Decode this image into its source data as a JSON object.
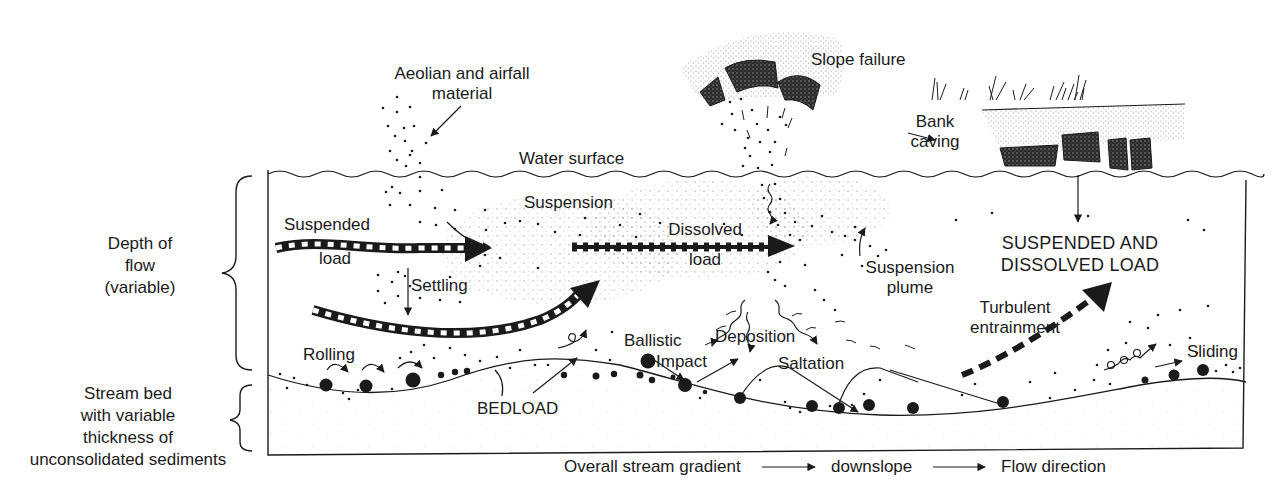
{
  "diagram": {
    "type": "stream sediment transport schematic",
    "labels": {
      "aeolian": [
        "Aeolian and airfall",
        "material"
      ],
      "slope_failure": "Slope failure",
      "bank_caving": [
        "Bank",
        "caving"
      ],
      "water_surface": "Water surface",
      "depth_of_flow": [
        "Depth of",
        "flow",
        "(variable)"
      ],
      "stream_bed": [
        "Stream bed",
        "with variable",
        "thickness of",
        "unconsolidated sediments"
      ],
      "suspended_load": [
        "Suspended",
        "load"
      ],
      "suspension": "Suspension",
      "dissolved_load": [
        "Dissolved",
        "load"
      ],
      "suspension_plume": [
        "Suspension",
        "plume"
      ],
      "suspended_and_dissolved": [
        "SUSPENDED AND",
        "DISSOLVED LOAD"
      ],
      "settling": "Settling",
      "turbulent_entrainment": [
        "Turbulent",
        "entrainment"
      ],
      "rolling": "Rolling",
      "ballistic_impact": [
        "Ballistic",
        "Impact"
      ],
      "deposition": "Deposition",
      "saltation": "Saltation",
      "sliding": "Sliding",
      "bedload": "BEDLOAD"
    },
    "legend": {
      "items": [
        "Overall stream gradient",
        "downslope",
        "Flow direction"
      ]
    },
    "colors": {
      "ink": "#1a1a1a",
      "stipple": "#9a9a9a",
      "background": "#ffffff"
    }
  }
}
